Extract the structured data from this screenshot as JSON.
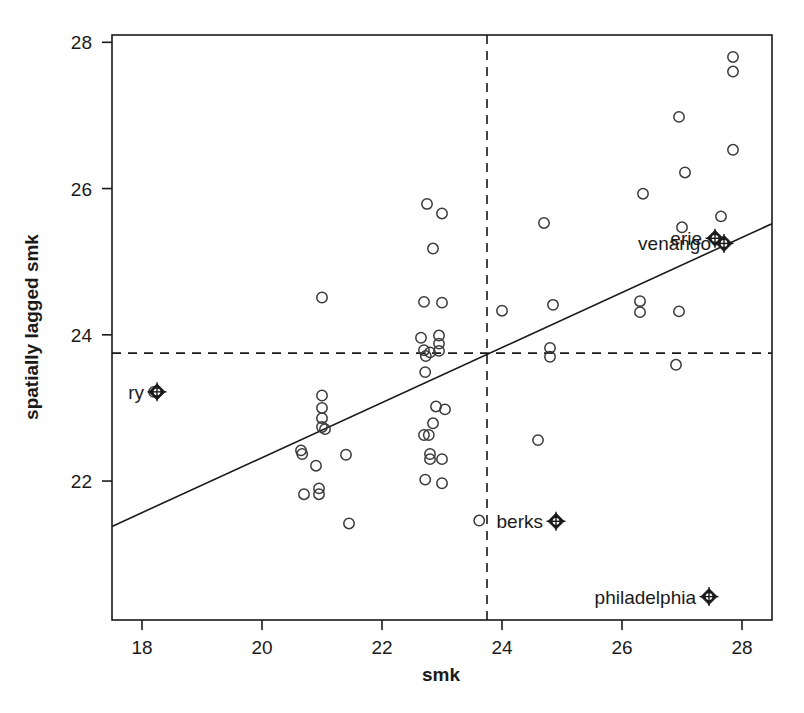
{
  "chart_data": {
    "type": "scatter",
    "title": "",
    "xlabel": "smk",
    "ylabel": "spatially lagged smk",
    "xlim": [
      17.5,
      28.5
    ],
    "ylim": [
      20.1,
      28.1
    ],
    "xticks": [
      18,
      20,
      22,
      24,
      26,
      28
    ],
    "yticks": [
      22,
      24,
      26,
      28
    ],
    "xtick_labels": [
      "18",
      "20",
      "22",
      "24",
      "26",
      "28"
    ],
    "ytick_labels": [
      "22",
      "24",
      "26",
      "28"
    ],
    "grid": false,
    "legend": "none",
    "reference_lines": [
      {
        "name": "mean-smk-vline",
        "orientation": "vertical",
        "value": 23.75,
        "style": "dashed"
      },
      {
        "name": "mean-lagged-smk-hline",
        "orientation": "horizontal",
        "value": 23.75,
        "style": "dashed"
      }
    ],
    "fit_line": {
      "name": "regression-line",
      "style": "solid",
      "x0": 17.5,
      "y0": 21.38,
      "x1": 28.5,
      "y1": 25.52
    },
    "points": [
      {
        "x": 27.85,
        "y": 27.8
      },
      {
        "x": 27.85,
        "y": 27.6
      },
      {
        "x": 26.95,
        "y": 26.98
      },
      {
        "x": 27.85,
        "y": 26.53
      },
      {
        "x": 27.05,
        "y": 26.22
      },
      {
        "x": 26.35,
        "y": 25.93
      },
      {
        "x": 27.65,
        "y": 25.62
      },
      {
        "x": 22.75,
        "y": 25.79
      },
      {
        "x": 23.0,
        "y": 25.66
      },
      {
        "x": 24.7,
        "y": 25.53
      },
      {
        "x": 27.0,
        "y": 25.47
      },
      {
        "x": 22.85,
        "y": 25.18
      },
      {
        "x": 21.0,
        "y": 24.51
      },
      {
        "x": 22.7,
        "y": 24.45
      },
      {
        "x": 23.0,
        "y": 24.44
      },
      {
        "x": 24.0,
        "y": 24.33
      },
      {
        "x": 24.85,
        "y": 24.41
      },
      {
        "x": 26.3,
        "y": 24.46
      },
      {
        "x": 26.3,
        "y": 24.31
      },
      {
        "x": 26.95,
        "y": 24.32
      },
      {
        "x": 22.65,
        "y": 23.96
      },
      {
        "x": 22.95,
        "y": 23.99
      },
      {
        "x": 22.95,
        "y": 23.88
      },
      {
        "x": 22.7,
        "y": 23.79
      },
      {
        "x": 22.8,
        "y": 23.76
      },
      {
        "x": 22.95,
        "y": 23.78
      },
      {
        "x": 22.73,
        "y": 23.71
      },
      {
        "x": 24.8,
        "y": 23.82
      },
      {
        "x": 24.8,
        "y": 23.7
      },
      {
        "x": 26.9,
        "y": 23.59
      },
      {
        "x": 22.72,
        "y": 23.49
      },
      {
        "x": 18.2,
        "y": 23.22
      },
      {
        "x": 21.0,
        "y": 23.17
      },
      {
        "x": 21.0,
        "y": 23.0
      },
      {
        "x": 21.0,
        "y": 22.86
      },
      {
        "x": 21.0,
        "y": 22.74
      },
      {
        "x": 21.05,
        "y": 22.71
      },
      {
        "x": 22.9,
        "y": 23.02
      },
      {
        "x": 23.05,
        "y": 22.98
      },
      {
        "x": 22.85,
        "y": 22.79
      },
      {
        "x": 22.7,
        "y": 22.63
      },
      {
        "x": 22.78,
        "y": 22.63
      },
      {
        "x": 20.65,
        "y": 22.42
      },
      {
        "x": 20.67,
        "y": 22.37
      },
      {
        "x": 21.4,
        "y": 22.36
      },
      {
        "x": 22.8,
        "y": 22.37
      },
      {
        "x": 22.8,
        "y": 22.3
      },
      {
        "x": 23.0,
        "y": 22.3
      },
      {
        "x": 24.6,
        "y": 22.56
      },
      {
        "x": 20.9,
        "y": 22.21
      },
      {
        "x": 22.72,
        "y": 22.02
      },
      {
        "x": 23.0,
        "y": 21.97
      },
      {
        "x": 20.7,
        "y": 21.82
      },
      {
        "x": 20.95,
        "y": 21.9
      },
      {
        "x": 20.95,
        "y": 21.82
      },
      {
        "x": 21.45,
        "y": 21.42
      },
      {
        "x": 23.62,
        "y": 21.46
      }
    ],
    "highlighted_points": [
      {
        "label": "ry",
        "x": 18.25,
        "y": 23.22,
        "label_side": "left"
      },
      {
        "label": "erie",
        "x": 27.55,
        "y": 25.32,
        "label_side": "left"
      },
      {
        "label": "venango",
        "x": 27.7,
        "y": 25.25,
        "label_side": "left"
      },
      {
        "label": "berks",
        "x": 24.9,
        "y": 21.45,
        "label_side": "left"
      },
      {
        "label": "philadelphia",
        "x": 27.45,
        "y": 20.42,
        "label_side": "left"
      }
    ]
  },
  "colors": {
    "axis": "#1a1a1a",
    "point_stroke": "#3a3a3a",
    "fit_line": "#1a1a1a",
    "dashed_line": "#1a1a1a",
    "background": "#ffffff"
  }
}
